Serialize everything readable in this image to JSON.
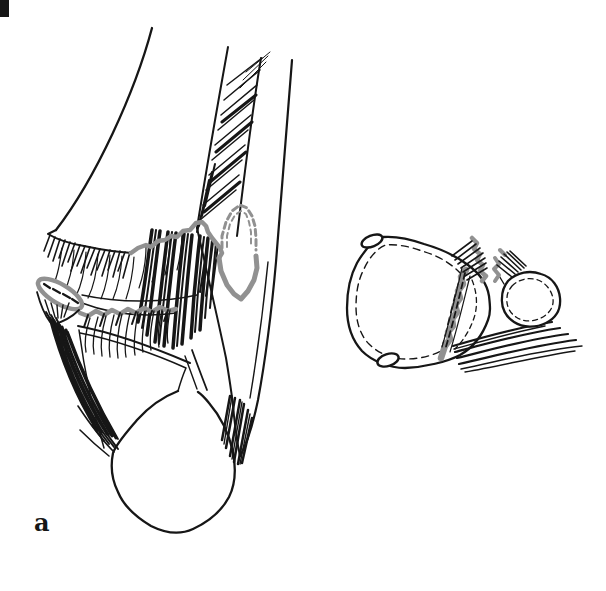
{
  "figure": {
    "panel_label": "a"
  },
  "colors": {
    "ink": "#161616",
    "fracture_gray": "#919191",
    "background": "#ffffff"
  }
}
